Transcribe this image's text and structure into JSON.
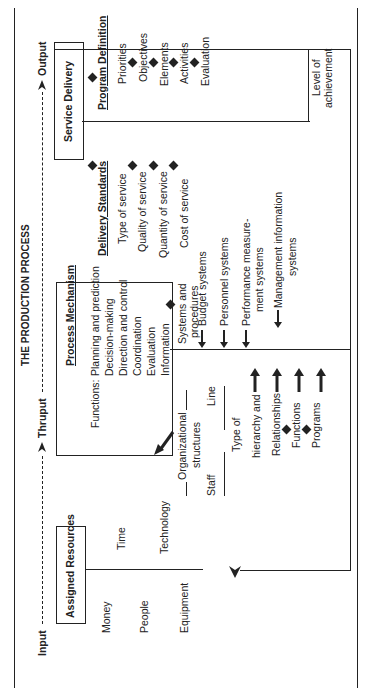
{
  "title": "THE PRODUCTION PROCESS",
  "flow": {
    "input": "Input",
    "thruput": "Thruput",
    "output": "Output"
  },
  "assigned_resources": {
    "heading": "Assigned Resources",
    "items": [
      "Money",
      "Time",
      "People",
      "Technology",
      "Equipment"
    ]
  },
  "process_mechanism": {
    "heading": "Process Mechanism",
    "functions_label": "Functions:",
    "functions": [
      "Planning and prediction",
      "Decision-making",
      "Direction and control",
      "Coordination",
      "Evaluation",
      "Information"
    ]
  },
  "organization": {
    "structures_label": [
      "Organizational",
      "structures"
    ],
    "line": "Line",
    "staff": "Staff",
    "type_label": [
      "Type of",
      "hierarchy and"
    ],
    "chain": [
      "Relationships",
      "Functions",
      "Programs"
    ]
  },
  "systems": {
    "heading": [
      "Systems and",
      "procedures"
    ],
    "items": [
      "Budget systems",
      "Personnel systems",
      "Performance measure-",
      "ment systems",
      "Management information",
      "systems"
    ]
  },
  "service_delivery": {
    "heading": "Service Delivery"
  },
  "delivery_standards": {
    "heading": "Delivery Standards",
    "items": [
      "Type of service",
      "Quality of service",
      "Quantity of service",
      "Cost of service"
    ]
  },
  "program_definition": {
    "heading": "Program Definition",
    "items": [
      "Priorities",
      "Objectives",
      "Elements",
      "Activities",
      "Evaluation"
    ]
  },
  "feedback": {
    "label": [
      "Level of",
      "achievement"
    ]
  }
}
